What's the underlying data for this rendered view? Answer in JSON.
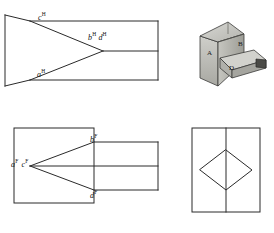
{
  "figure": {
    "background_color": "#ffffff",
    "line_color": "#222222"
  },
  "views": {
    "top": {
      "name": "Horizontal (top) view",
      "labels": [
        {
          "id": "c-h",
          "text": "c",
          "sup": "H",
          "x": 38,
          "y": 13
        },
        {
          "id": "bd-h",
          "text": "b",
          "sup": "H",
          "text2": "d",
          "sup2": "H",
          "x": 88,
          "y": 33
        },
        {
          "id": "a-h",
          "text": "a",
          "sup": "H",
          "x": 37,
          "y": 70
        }
      ]
    },
    "front": {
      "name": "Frontal (front) view",
      "labels": [
        {
          "id": "b-f",
          "text": "b",
          "sup": "F",
          "x": 90,
          "y": 135
        },
        {
          "id": "ac-f",
          "text": "a",
          "sup": "F",
          "text2": "c",
          "sup2": "F",
          "x": 11,
          "y": 160
        },
        {
          "id": "d-f",
          "text": "d",
          "sup": "F",
          "x": 90,
          "y": 191
        }
      ]
    },
    "side": {
      "name": "Profile (side) view",
      "labels": []
    },
    "pictorial": {
      "name": "Isometric pictorial",
      "labels": [
        {
          "id": "pic-b",
          "text": "B",
          "x": 238,
          "y": 42
        },
        {
          "id": "pic-a",
          "text": "A",
          "x": 208,
          "y": 51
        },
        {
          "id": "pic-d",
          "text": "D",
          "x": 229,
          "y": 66
        }
      ]
    }
  }
}
